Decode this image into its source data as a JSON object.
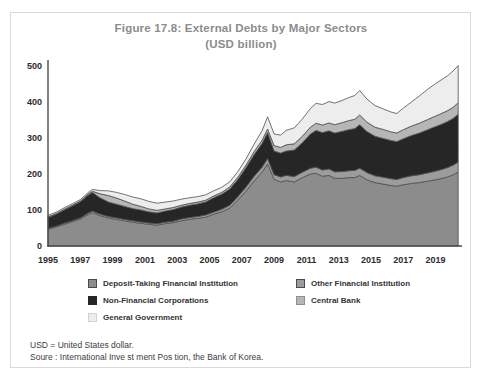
{
  "title": "Figure 17.8: External Debts by Major Sectors",
  "subtitle": "(USD billion)",
  "y_axis": {
    "ticks": [
      0,
      100,
      200,
      300,
      400,
      500
    ]
  },
  "x_axis": {
    "ticks": [
      1995,
      1997,
      1999,
      2001,
      2003,
      2005,
      2007,
      2009,
      2011,
      2013,
      2015,
      2017,
      2019
    ]
  },
  "chart_data": {
    "type": "area",
    "stacked": true,
    "title": "Figure 17.8: External Debts by Major Sectors",
    "subtitle": "(USD billion)",
    "unit": "USD billion",
    "xlabel": "",
    "ylabel": "",
    "ylim": [
      0,
      500
    ],
    "xlim": [
      1995,
      2020.5
    ],
    "grid": false,
    "legend_position": "bottom",
    "outline_color": "#4f4f4f",
    "x": [
      1995.0,
      1995.5,
      1996.0,
      1996.5,
      1997.0,
      1997.5,
      1997.75,
      1998.25,
      1998.75,
      1999.25,
      1999.75,
      2000.25,
      2000.75,
      2001.25,
      2001.75,
      2002.25,
      2002.75,
      2003.25,
      2003.75,
      2004.25,
      2004.75,
      2005.25,
      2005.75,
      2006.25,
      2006.75,
      2007.25,
      2007.75,
      2008.25,
      2008.6,
      2009.0,
      2009.4,
      2009.75,
      2010.25,
      2010.75,
      2011.25,
      2011.6,
      2012.0,
      2012.4,
      2012.75,
      2013.25,
      2013.6,
      2014.0,
      2014.3,
      2014.75,
      2015.25,
      2015.75,
      2016.25,
      2016.6,
      2017.0,
      2017.5,
      2018.0,
      2018.5,
      2019.0,
      2019.4,
      2019.75,
      2020.1,
      2020.4
    ],
    "series": [
      {
        "name": "Deposit-Taking Financial Institution",
        "color": "#8c8c8c",
        "values": [
          47,
          53,
          60,
          67,
          75,
          88,
          93,
          84,
          78,
          74,
          70,
          66,
          63,
          60,
          58,
          62,
          65,
          70,
          74,
          77,
          80,
          88,
          95,
          105,
          128,
          152,
          180,
          205,
          228,
          185,
          178,
          182,
          178,
          190,
          200,
          202,
          194,
          196,
          188,
          188,
          190,
          190,
          196,
          184,
          176,
          172,
          168,
          166,
          170,
          174,
          176,
          180,
          184,
          188,
          192,
          198,
          205
        ]
      },
      {
        "name": "Other Financial Institution",
        "color": "#9c9c9c",
        "values": [
          2,
          2,
          3,
          3,
          3,
          4,
          4,
          4,
          4,
          4,
          4,
          4,
          4,
          4,
          4,
          4,
          4,
          5,
          5,
          5,
          6,
          6,
          7,
          8,
          9,
          11,
          13,
          14,
          15,
          13,
          14,
          14,
          15,
          15,
          16,
          17,
          17,
          18,
          18,
          19,
          19,
          20,
          20,
          20,
          19,
          19,
          19,
          19,
          20,
          21,
          22,
          23,
          24,
          25,
          26,
          27,
          28
        ]
      },
      {
        "name": "Non-Financial Corporations",
        "color": "#262626",
        "values": [
          30,
          33,
          37,
          41,
          45,
          50,
          52,
          45,
          40,
          38,
          36,
          34,
          33,
          31,
          30,
          31,
          32,
          33,
          34,
          35,
          36,
          40,
          42,
          45,
          48,
          54,
          60,
          66,
          72,
          66,
          66,
          68,
          74,
          82,
          95,
          102,
          104,
          106,
          108,
          112,
          114,
          116,
          121,
          114,
          110,
          108,
          106,
          105,
          108,
          112,
          116,
          120,
          124,
          126,
          128,
          130,
          133
        ]
      },
      {
        "name": "Central Bank",
        "color": "#b6b6b6",
        "values": [
          2,
          2,
          2,
          2,
          2,
          3,
          3,
          12,
          18,
          17,
          15,
          12,
          10,
          8,
          7,
          6,
          6,
          5,
          5,
          5,
          5,
          5,
          5,
          6,
          6,
          7,
          8,
          9,
          10,
          15,
          16,
          17,
          17,
          18,
          19,
          20,
          21,
          22,
          23,
          24,
          25,
          26,
          27,
          26,
          25,
          25,
          24,
          24,
          25,
          26,
          27,
          28,
          29,
          30,
          30,
          31,
          32
        ]
      },
      {
        "name": "General Government",
        "color": "#ededed",
        "values": [
          4,
          4,
          4,
          4,
          4,
          4,
          5,
          9,
          13,
          16,
          18,
          20,
          21,
          21,
          20,
          19,
          18,
          17,
          16,
          15,
          15,
          14,
          14,
          14,
          15,
          17,
          21,
          26,
          34,
          32,
          34,
          40,
          44,
          48,
          52,
          55,
          57,
          59,
          60,
          62,
          64,
          66,
          68,
          64,
          60,
          57,
          55,
          54,
          60,
          67,
          76,
          84,
          90,
          94,
          97,
          101,
          103
        ]
      }
    ]
  },
  "legend": {
    "items": [
      {
        "label": "Deposit-Taking Financial Institution",
        "color": "#8c8c8c",
        "border": "#4a4a4a",
        "column": 0
      },
      {
        "label": "Other Financial Institution",
        "color": "#9c9c9c",
        "border": "#4a4a4a",
        "column": 1
      },
      {
        "label": "Non-Financial Corporations",
        "color": "#262626",
        "border": "#262626",
        "column": 0
      },
      {
        "label": "Central Bank",
        "color": "#b6b6b6",
        "border": "#8f8f8f",
        "column": 1
      },
      {
        "label": "General Government",
        "color": "#ededed",
        "border": "#d2d2d2",
        "column": 0
      }
    ]
  },
  "footnotes": [
    "USD = United States dollar.",
    "Soure : International Inve st ment Pos tion, the Bank of Korea."
  ]
}
